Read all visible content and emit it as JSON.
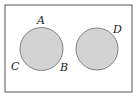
{
  "diagram": {
    "type": "venn",
    "frame": {
      "x": 5,
      "y": 5,
      "width": 127,
      "height": 87,
      "stroke": "#555555"
    },
    "circles": [
      {
        "id": "left",
        "cx": 41.5,
        "cy": 49,
        "r": 21.5,
        "fill": "#d3d3d3",
        "stroke": "#666666"
      },
      {
        "id": "right",
        "cx": 97,
        "cy": 49,
        "r": 21,
        "fill": "#d3d3d3",
        "stroke": "#666666"
      }
    ],
    "labels": [
      {
        "text": "A",
        "x": 37,
        "y": 24
      },
      {
        "text": "B",
        "x": 60,
        "y": 71
      },
      {
        "text": "C",
        "x": 11,
        "y": 70
      },
      {
        "text": "D",
        "x": 113,
        "y": 33
      }
    ]
  }
}
